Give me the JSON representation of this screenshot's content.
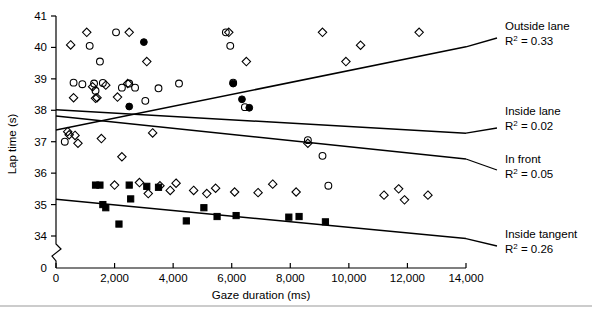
{
  "chart_data": {
    "type": "scatter",
    "title": "",
    "xlabel": "Gaze duration (ms)",
    "ylabel": "Lap time (s)",
    "xlim": [
      0,
      14000
    ],
    "ylim": [
      33.6,
      41.0
    ],
    "y_axis_break": true,
    "y_break_label": "0",
    "grid": false,
    "legend_position": "right",
    "xticks": [
      0,
      2000,
      4000,
      6000,
      8000,
      10000,
      12000,
      14000
    ],
    "xticklabels": [
      "0",
      "2,000",
      "4,000",
      "6,000",
      "8,000",
      "10,000",
      "12,000",
      "14,000"
    ],
    "yticks": [
      34,
      35,
      36,
      37,
      38,
      39,
      40,
      41
    ],
    "yticklabels": [
      "34",
      "35",
      "36",
      "37",
      "38",
      "39",
      "40",
      "41"
    ],
    "series": [
      {
        "name": "Outside lane",
        "marker": "filled-circle",
        "r_squared": 0.33,
        "r2_label": "R2 = 0.33",
        "legend_label": "Outside lane",
        "fit": {
          "x0": 0,
          "y0": 37.37,
          "x1": 14000,
          "y1": 40.02
        },
        "points": [
          [
            3000,
            40.17
          ],
          [
            2500,
            38.12
          ],
          [
            6050,
            38.85
          ],
          [
            6350,
            38.35
          ],
          [
            6600,
            38.08
          ]
        ]
      },
      {
        "name": "Inside lane",
        "marker": "open-circle",
        "r_squared": 0.02,
        "r2_label": "R2 = 0.02",
        "legend_label": "Inside lane",
        "fit": {
          "x0": 0,
          "y0": 38.02,
          "x1": 14000,
          "y1": 37.27
        },
        "points": [
          [
            300,
            37.0
          ],
          [
            600,
            38.88
          ],
          [
            900,
            38.83
          ],
          [
            1150,
            40.05
          ],
          [
            1300,
            38.85
          ],
          [
            1350,
            38.62
          ],
          [
            1500,
            39.55
          ],
          [
            1600,
            38.87
          ],
          [
            2050,
            40.48
          ],
          [
            2250,
            38.72
          ],
          [
            2500,
            38.85
          ],
          [
            2700,
            38.72
          ],
          [
            3050,
            38.3
          ],
          [
            3500,
            38.7
          ],
          [
            4200,
            38.85
          ],
          [
            5800,
            40.48
          ],
          [
            5950,
            40.05
          ],
          [
            6050,
            38.88
          ],
          [
            6450,
            38.1
          ],
          [
            8600,
            37.05
          ],
          [
            9100,
            36.55
          ],
          [
            9300,
            35.6
          ]
        ]
      },
      {
        "name": "In front",
        "marker": "open-diamond",
        "r_squared": 0.05,
        "r2_label": "R2 = 0.05",
        "legend_label": "In front",
        "fit": {
          "x0": 0,
          "y0": 37.82,
          "x1": 14000,
          "y1": 36.45
        },
        "points": [
          [
            400,
            37.32
          ],
          [
            450,
            37.22
          ],
          [
            500,
            40.08
          ],
          [
            600,
            38.4
          ],
          [
            650,
            37.2
          ],
          [
            750,
            36.95
          ],
          [
            1050,
            40.48
          ],
          [
            1250,
            38.75
          ],
          [
            1350,
            38.38
          ],
          [
            1400,
            38.4
          ],
          [
            1550,
            37.1
          ],
          [
            1700,
            38.8
          ],
          [
            2000,
            35.62
          ],
          [
            2100,
            38.42
          ],
          [
            2250,
            36.52
          ],
          [
            2450,
            38.85
          ],
          [
            2500,
            40.48
          ],
          [
            2850,
            35.7
          ],
          [
            3100,
            39.55
          ],
          [
            3150,
            35.35
          ],
          [
            3300,
            37.28
          ],
          [
            3550,
            35.6
          ],
          [
            3900,
            35.45
          ],
          [
            4100,
            35.68
          ],
          [
            4700,
            35.45
          ],
          [
            5150,
            35.35
          ],
          [
            5450,
            35.52
          ],
          [
            5900,
            40.48
          ],
          [
            6100,
            35.4
          ],
          [
            6500,
            39.55
          ],
          [
            6900,
            35.38
          ],
          [
            7400,
            35.65
          ],
          [
            8200,
            35.4
          ],
          [
            8600,
            36.95
          ],
          [
            9100,
            40.48
          ],
          [
            9900,
            39.55
          ],
          [
            10400,
            40.07
          ],
          [
            11200,
            35.3
          ],
          [
            11700,
            35.5
          ],
          [
            11900,
            35.15
          ],
          [
            12400,
            40.48
          ],
          [
            12700,
            35.3
          ]
        ]
      },
      {
        "name": "Inside tangent",
        "marker": "filled-square",
        "r_squared": 0.26,
        "r2_label": "R2 = 0.26",
        "legend_label": "Inside tangent",
        "fit": {
          "x0": 0,
          "y0": 35.17,
          "x1": 14000,
          "y1": 33.92
        },
        "points": [
          [
            1350,
            35.62
          ],
          [
            1500,
            35.62
          ],
          [
            1600,
            35.0
          ],
          [
            1700,
            34.9
          ],
          [
            2150,
            34.38
          ],
          [
            2500,
            35.62
          ],
          [
            2550,
            35.18
          ],
          [
            3100,
            35.58
          ],
          [
            3500,
            35.55
          ],
          [
            4450,
            34.48
          ],
          [
            5050,
            34.9
          ],
          [
            5500,
            34.62
          ],
          [
            6150,
            34.65
          ],
          [
            7950,
            34.6
          ],
          [
            8300,
            34.62
          ],
          [
            9200,
            34.45
          ]
        ]
      }
    ],
    "legend_entries": [
      {
        "label": "Outside lane",
        "r2_value": "0.33"
      },
      {
        "label": "Inside lane",
        "r2_value": "0.02"
      },
      {
        "label": "In front",
        "r2_value": "0.05"
      },
      {
        "label": "Inside tangent",
        "r2_value": "0.26"
      }
    ]
  }
}
